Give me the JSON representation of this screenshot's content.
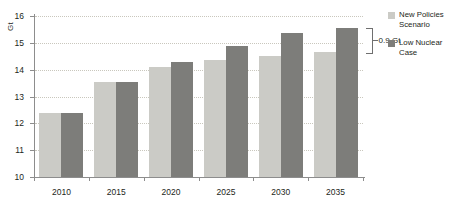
{
  "chart_data": {
    "type": "bar",
    "title": "",
    "subtitle": "",
    "xlabel": "",
    "ylabel": "Gt",
    "unit_label": "Gt",
    "categories": [
      "2010",
      "2015",
      "2020",
      "2025",
      "2030",
      "2035"
    ],
    "series": [
      {
        "name": "New Policies Scenario",
        "color": "#cbcbc6",
        "values": [
          12.4,
          13.55,
          14.1,
          14.35,
          14.5,
          14.65
        ]
      },
      {
        "name": "Low Nuclear Case",
        "color": "#7d7d7a",
        "values": [
          12.4,
          13.55,
          14.3,
          14.9,
          15.35,
          15.55
        ]
      }
    ],
    "ylim": [
      10,
      16
    ],
    "yticks": [
      10,
      11,
      12,
      13,
      14,
      15,
      16
    ],
    "ytick_labels": [
      "10",
      "11",
      "12",
      "13",
      "14",
      "15",
      "16"
    ],
    "grid": true,
    "legend_position": "right",
    "annotations": [
      {
        "text": "0.9 Gt",
        "type": "bracket",
        "category": "2035",
        "from_value": 14.65,
        "to_value": 15.55,
        "delta": 0.9
      }
    ]
  },
  "legend": {
    "items": [
      {
        "label": "New Policies Scenario",
        "color": "#cbcbc6"
      },
      {
        "label": "Low Nuclear Case",
        "color": "#7d7d7a"
      }
    ]
  },
  "axis": {
    "y_unit": "Gt"
  }
}
